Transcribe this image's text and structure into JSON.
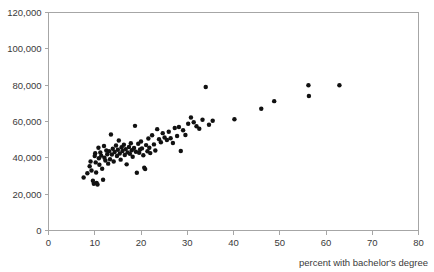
{
  "chart_data": {
    "type": "scatter",
    "title": "",
    "xlabel": "percent with bachelor's degree",
    "ylabel": "",
    "xlim": [
      0,
      80
    ],
    "ylim": [
      0,
      120000
    ],
    "grid": false,
    "legend": null,
    "x_ticks": [
      "0",
      "10",
      "20",
      "30",
      "40",
      "50",
      "60",
      "70",
      "80"
    ],
    "x_tick_values": [
      0,
      10,
      20,
      30,
      40,
      50,
      60,
      70,
      80
    ],
    "y_ticks": [
      "0",
      "20,000",
      "40,000",
      "60,000",
      "80,000",
      "100,000",
      "120,000"
    ],
    "y_tick_values": [
      0,
      20000,
      40000,
      60000,
      80000,
      100000,
      120000
    ],
    "marker": "filled-circle",
    "marker_color": "#111111",
    "marker_size": 3,
    "n_points": 99,
    "points": [
      [
        7.6,
        29200
      ],
      [
        8.4,
        31500
      ],
      [
        8.9,
        35400
      ],
      [
        9.1,
        38000
      ],
      [
        9.3,
        33000
      ],
      [
        9.6,
        27400
      ],
      [
        9.8,
        25700
      ],
      [
        10.0,
        41000
      ],
      [
        10.1,
        42500
      ],
      [
        10.2,
        37500
      ],
      [
        10.3,
        31900
      ],
      [
        10.4,
        26200
      ],
      [
        10.6,
        25300
      ],
      [
        10.8,
        45500
      ],
      [
        10.9,
        39800
      ],
      [
        11.0,
        36200
      ],
      [
        11.2,
        43000
      ],
      [
        11.4,
        41200
      ],
      [
        11.6,
        34000
      ],
      [
        11.8,
        27900
      ],
      [
        12.0,
        46500
      ],
      [
        12.1,
        40000
      ],
      [
        12.3,
        38500
      ],
      [
        12.5,
        44000
      ],
      [
        12.7,
        42000
      ],
      [
        12.9,
        36800
      ],
      [
        13.1,
        43600
      ],
      [
        13.3,
        39200
      ],
      [
        13.5,
        52800
      ],
      [
        13.7,
        41800
      ],
      [
        13.9,
        45000
      ],
      [
        14.1,
        38000
      ],
      [
        14.3,
        43200
      ],
      [
        14.6,
        46800
      ],
      [
        14.8,
        41000
      ],
      [
        15.0,
        44500
      ],
      [
        15.2,
        49500
      ],
      [
        15.4,
        42400
      ],
      [
        15.6,
        39000
      ],
      [
        15.8,
        45800
      ],
      [
        16.0,
        43800
      ],
      [
        16.3,
        47200
      ],
      [
        16.5,
        41600
      ],
      [
        16.7,
        44800
      ],
      [
        16.9,
        36400
      ],
      [
        17.1,
        43000
      ],
      [
        17.4,
        46000
      ],
      [
        17.6,
        42200
      ],
      [
        17.8,
        48000
      ],
      [
        18.0,
        44200
      ],
      [
        18.2,
        40600
      ],
      [
        18.5,
        45400
      ],
      [
        18.7,
        57600
      ],
      [
        18.9,
        43400
      ],
      [
        19.1,
        31800
      ],
      [
        19.4,
        47800
      ],
      [
        19.6,
        42800
      ],
      [
        19.8,
        44600
      ],
      [
        20.0,
        49000
      ],
      [
        20.2,
        45200
      ],
      [
        20.5,
        41400
      ],
      [
        20.7,
        34600
      ],
      [
        20.9,
        33800
      ],
      [
        21.1,
        47000
      ],
      [
        21.4,
        43600
      ],
      [
        21.6,
        50600
      ],
      [
        21.8,
        45600
      ],
      [
        22.0,
        42600
      ],
      [
        22.4,
        52400
      ],
      [
        22.8,
        47400
      ],
      [
        23.1,
        44000
      ],
      [
        23.5,
        55800
      ],
      [
        23.9,
        50200
      ],
      [
        24.3,
        48600
      ],
      [
        24.7,
        53600
      ],
      [
        25.1,
        51200
      ],
      [
        25.6,
        49800
      ],
      [
        26.0,
        54400
      ],
      [
        26.4,
        50800
      ],
      [
        26.9,
        48200
      ],
      [
        27.3,
        56400
      ],
      [
        27.8,
        52000
      ],
      [
        28.2,
        57000
      ],
      [
        28.6,
        43800
      ],
      [
        29.1,
        55200
      ],
      [
        29.6,
        52600
      ],
      [
        30.2,
        58800
      ],
      [
        30.8,
        62200
      ],
      [
        31.4,
        59600
      ],
      [
        32.0,
        57400
      ],
      [
        32.6,
        56000
      ],
      [
        33.3,
        61000
      ],
      [
        34.0,
        79000
      ],
      [
        34.7,
        58200
      ],
      [
        35.5,
        60400
      ],
      [
        40.2,
        61200
      ],
      [
        46.0,
        67000
      ],
      [
        48.8,
        71200
      ],
      [
        56.2,
        80000
      ],
      [
        56.3,
        74000
      ],
      [
        62.9,
        80000
      ]
    ]
  }
}
